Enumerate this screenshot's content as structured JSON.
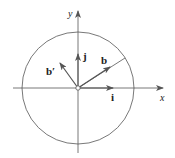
{
  "diagram": {
    "title": "",
    "colors": {
      "stroke": "#555555",
      "text": "#222222",
      "background": "#ffffff"
    },
    "axes": {
      "x_label": "x",
      "y_label": "y"
    },
    "circle": {
      "cx": 78,
      "cy": 88,
      "r": 56
    },
    "vectors": [
      {
        "id": "i",
        "label": "i",
        "from": [
          78,
          88
        ],
        "to": [
          113,
          88
        ]
      },
      {
        "id": "j",
        "label": "j",
        "from": [
          78,
          88
        ],
        "to": [
          78,
          54
        ]
      },
      {
        "id": "b",
        "label": "b",
        "from": [
          78,
          88
        ],
        "to": [
          110,
          67
        ]
      },
      {
        "id": "b-prime",
        "label": "b′",
        "from": [
          78,
          88
        ],
        "to": [
          60,
          63
        ]
      }
    ],
    "radius_line": {
      "from": [
        78,
        88
      ],
      "to": [
        125,
        58
      ]
    }
  }
}
